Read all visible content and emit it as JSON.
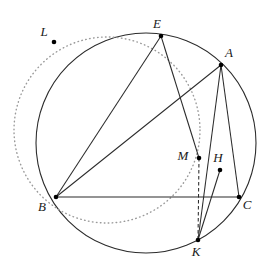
{
  "figure": {
    "width": 270,
    "height": 269,
    "background_color": "#ffffff",
    "stroke_color": "#2b2b2b",
    "dotted_color": "#9a9a9a",
    "point_color": "#000000"
  },
  "circles": [
    {
      "name": "circumcircle",
      "style": "solid",
      "cx": 146,
      "cy": 143,
      "r": 110,
      "color": "#2b2b2b"
    },
    {
      "name": "dotted-circle",
      "style": "dotted",
      "cx": 107,
      "cy": 130,
      "r": 93,
      "color": "#9a9a9a"
    }
  ],
  "points": [
    {
      "id": "L",
      "label": "L",
      "x": 54,
      "y": 42,
      "label_dx": -10,
      "label_dy": -6
    },
    {
      "id": "E",
      "label": "E",
      "x": 161,
      "y": 36,
      "label_dx": -4,
      "label_dy": -8
    },
    {
      "id": "A",
      "label": "A",
      "x": 221,
      "y": 65,
      "label_dx": 8,
      "label_dy": -8
    },
    {
      "id": "B",
      "label": "B",
      "x": 56,
      "y": 197,
      "label_dx": -14,
      "label_dy": 14
    },
    {
      "id": "C",
      "label": "C",
      "x": 239,
      "y": 197,
      "label_dx": 8,
      "label_dy": 12
    },
    {
      "id": "M",
      "label": "M",
      "x": 199,
      "y": 158,
      "label_dx": -16,
      "label_dy": 2
    },
    {
      "id": "H",
      "label": "H",
      "x": 220,
      "y": 170,
      "label_dx": -2,
      "label_dy": -8
    },
    {
      "id": "K",
      "label": "K",
      "x": 198,
      "y": 240,
      "label_dx": -2,
      "label_dy": 16
    }
  ],
  "segments": [
    {
      "name": "segment-E-M",
      "from": "E",
      "to": "M",
      "style": "solid"
    },
    {
      "name": "segment-M-K",
      "from": "M",
      "to": "K",
      "style": "dashed"
    },
    {
      "name": "segment-E-B",
      "from": "E",
      "to": "B",
      "style": "solid"
    },
    {
      "name": "segment-A-B",
      "from": "A",
      "to": "B",
      "style": "solid"
    },
    {
      "name": "segment-A-C",
      "from": "A",
      "to": "C",
      "style": "solid"
    },
    {
      "name": "segment-B-C",
      "from": "B",
      "to": "C",
      "style": "solid"
    },
    {
      "name": "segment-H-K",
      "from": "H",
      "to": "K",
      "style": "solid"
    },
    {
      "name": "segment-A-K",
      "from": "A",
      "to": "K",
      "style": "solid"
    }
  ]
}
